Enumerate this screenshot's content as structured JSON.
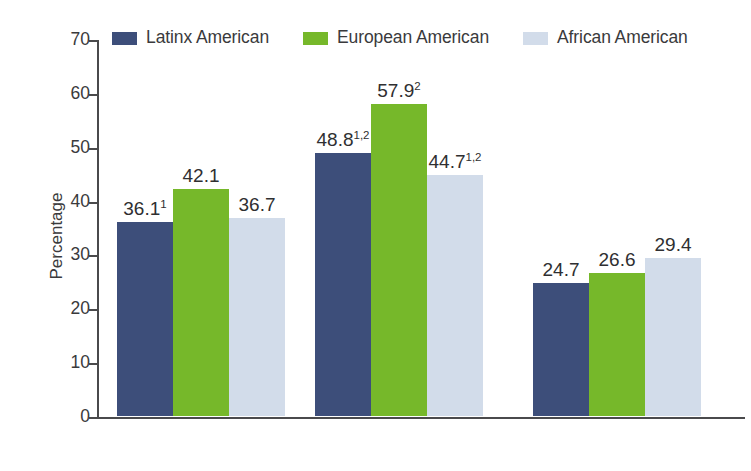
{
  "chart_data": {
    "type": "bar",
    "title": "",
    "xlabel": "",
    "ylabel": "Percentage",
    "ylim": [
      0,
      70
    ],
    "yticks": [
      0,
      10,
      20,
      30,
      40,
      50,
      60,
      70
    ],
    "grid": false,
    "legend_position": "top",
    "categories": [
      "Total",
      "Women",
      "Men"
    ],
    "series": [
      {
        "name": "Latinx American",
        "color": "#3d4e7a",
        "values": [
          36.1,
          48.8,
          24.7
        ],
        "labels": [
          "36.1",
          "48.8",
          "24.7"
        ],
        "superscripts": [
          "1",
          "1,2",
          ""
        ]
      },
      {
        "name": "European American",
        "color": "#76b82a",
        "values": [
          42.1,
          57.9,
          26.6
        ],
        "labels": [
          "42.1",
          "57.9",
          "26.6"
        ],
        "superscripts": [
          "",
          "2",
          ""
        ]
      },
      {
        "name": "African American",
        "color": "#d2dcea",
        "values": [
          36.7,
          44.7,
          29.4
        ],
        "labels": [
          "36.7",
          "44.7",
          "29.4"
        ],
        "superscripts": [
          "",
          "1,2",
          ""
        ]
      }
    ]
  },
  "axis": {
    "y_title": "Percentage",
    "tick_labels": [
      "70",
      "60",
      "50",
      "40",
      "30",
      "20",
      "10",
      "0"
    ]
  },
  "legend": {
    "items": [
      {
        "label": "Latinx American",
        "color": "#3d4e7a"
      },
      {
        "label": "European American",
        "color": "#76b82a"
      },
      {
        "label": "African American",
        "color": "#d2dcea"
      }
    ]
  },
  "categories": [
    {
      "label": "Total"
    },
    {
      "label": "Women"
    },
    {
      "label": "Men"
    }
  ]
}
